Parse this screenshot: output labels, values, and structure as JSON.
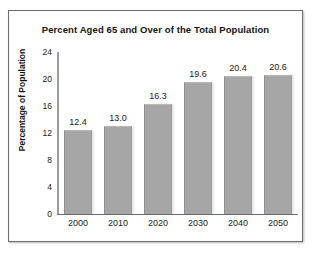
{
  "chart_data": {
    "type": "bar",
    "title": "Percent Aged 65 and Over of the Total Population",
    "xlabel": "",
    "ylabel": "Percentage of Population",
    "categories": [
      "2000",
      "2010",
      "2020",
      "2030",
      "2040",
      "2050"
    ],
    "values": [
      12.4,
      13.0,
      16.3,
      19.6,
      20.4,
      20.6
    ],
    "value_labels": [
      "12.4",
      "13.0",
      "16.3",
      "19.6",
      "20.4",
      "20.6"
    ],
    "ylim": [
      0,
      24
    ],
    "yticks": [
      24,
      20,
      16,
      12,
      8,
      4,
      0
    ],
    "ytick_labels": [
      "24",
      "20",
      "16",
      "12",
      "8",
      "4",
      "0"
    ],
    "grid": false,
    "legend": false,
    "legend_position": "none",
    "bar_color": "#a6a6a6",
    "axis_color": "#6d6d6d",
    "text_color": "#14140f",
    "background_color": "#ffffff",
    "frame_border_color": "#6d6d6d"
  }
}
